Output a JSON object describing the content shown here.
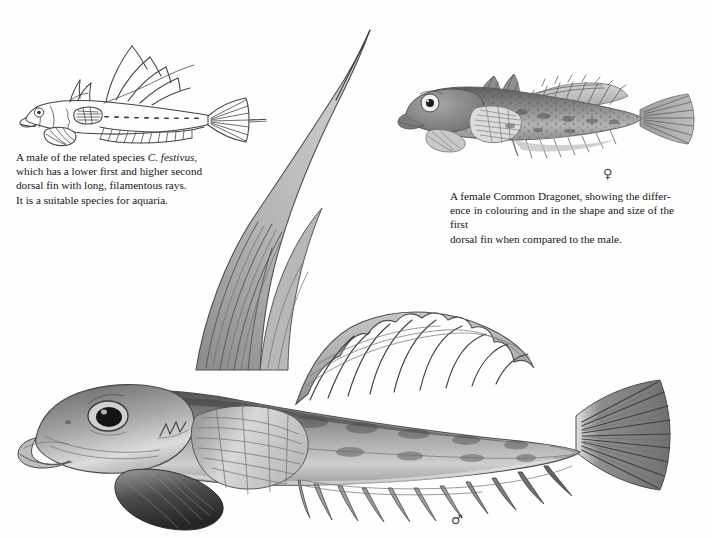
{
  "page": {
    "background_color": "#ffffff",
    "kind": "book-plate"
  },
  "captions": {
    "left": {
      "name": "festivus-caption",
      "lines": [
        {
          "pre": "A male of the related species ",
          "italic": "C. festivus,",
          "post": ""
        },
        {
          "pre": "which has a lower first and higher second",
          "italic": "",
          "post": ""
        },
        {
          "pre": "dorsal fin with long, filamentous rays.",
          "italic": "",
          "post": ""
        },
        {
          "pre": "It is a suitable species for aquaria.",
          "italic": "",
          "post": ""
        }
      ],
      "full_text": "A male of the related species C. festivus, which has a lower first and higher second dorsal fin with long, filamentous rays. It is a suitable species for aquaria."
    },
    "right": {
      "name": "female-dragonet-caption",
      "lines": [
        "A female Common Dragonet, showing the differ-",
        "ence in colouring and in the shape and size of the first",
        "dorsal fin when compared to the male."
      ],
      "full_text": "A female Common Dragonet, showing the difference in colouring and in the shape and size of the first dorsal fin when compared to the male."
    }
  },
  "symbols": {
    "female": "♀",
    "male": "♂"
  },
  "figures": {
    "festivus": {
      "label": "line-drawing-male-c-festivus",
      "style": "ink line drawing",
      "stroke_color": "#3a3a3a"
    },
    "female_dragonet": {
      "label": "grayscale-painting-female-common-dragonet",
      "style": "grayscale wash painting",
      "body_tone": "#8d8d8d"
    },
    "male_dragonet": {
      "label": "grayscale-painting-male-common-dragonet",
      "style": "grayscale wash painting",
      "body_tone": "#9a9a9a",
      "feature": "very tall first dorsal fin with long filament"
    }
  }
}
